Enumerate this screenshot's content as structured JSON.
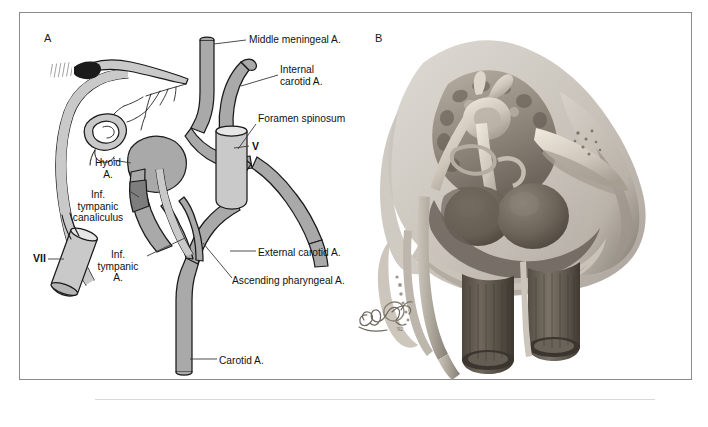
{
  "figure": {
    "panels": [
      {
        "letter": "A",
        "kind": "schematic-line-drawing",
        "description": "Grayscale schematic of the hyoid-stapedial / carotid arterial system of the temporal bone region"
      },
      {
        "letter": "B",
        "kind": "shaded-anatomical-rendering",
        "description": "Airbrushed anatomical rendering of the petrous temporal bone, ossicles and great vessels"
      }
    ]
  },
  "panel_a": {
    "letter": "A",
    "labels": [
      {
        "id": "middle-meningeal",
        "text": "Middle meningeal A."
      },
      {
        "id": "internal-carotid",
        "text": "Internal\ncarotid A."
      },
      {
        "id": "foramen-spinosum",
        "text": "Foramen spinosum"
      },
      {
        "id": "nerve-v",
        "text": "V"
      },
      {
        "id": "hyoid",
        "text": "Hyoid\nA."
      },
      {
        "id": "inf-tympanic-canaliculus",
        "text": "Inf.\ntympanic\ncanaliculus"
      },
      {
        "id": "nerve-vii",
        "text": "VII"
      },
      {
        "id": "inf-tympanic-a",
        "text": "Inf.\ntympanic\nA."
      },
      {
        "id": "external-carotid",
        "text": "External carotid A."
      },
      {
        "id": "ascending-pharyngeal",
        "text": "Ascending pharyngeal A."
      },
      {
        "id": "carotid",
        "text": "Carotid A."
      }
    ]
  },
  "panel_b": {
    "letter": "B",
    "signature": "artist-signature"
  },
  "colors": {
    "vessel_mid_gray": "#a9a9a9",
    "vessel_light_gray": "#c9c9c9",
    "vessel_dark_band": "#7d7d7d",
    "outline": "#1a1a1a",
    "leader_line": "#4a4a4a",
    "frame_border": "#8a8a8a",
    "bone_light": "#cfcbc4",
    "bone_mid": "#a49c92",
    "bone_dark": "#6f675e",
    "vessel_b_dark": "#5d5750",
    "page_background": "#ffffff"
  }
}
